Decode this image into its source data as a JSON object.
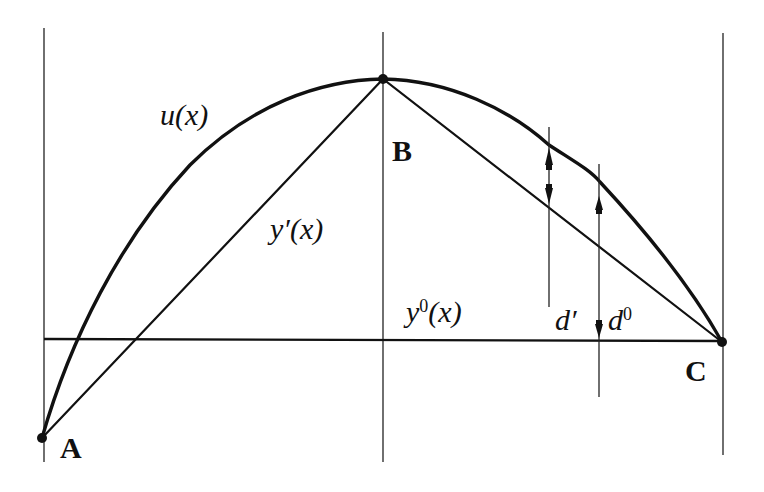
{
  "diagram": {
    "points": {
      "A": {
        "label": "A",
        "x": 42,
        "y": 438
      },
      "B": {
        "label": "B",
        "x": 383,
        "y": 79
      },
      "C": {
        "label": "C",
        "x": 722,
        "y": 342
      }
    },
    "curves": {
      "u": {
        "label_main": "u(x)"
      },
      "y_prime": {
        "label_base": "y",
        "label_mark": "′",
        "label_arg": "(x)"
      },
      "y_zero": {
        "label_base": "y",
        "label_sup": "0",
        "label_arg": "(x)"
      }
    },
    "distances": {
      "d_prime": {
        "label_base": "d",
        "label_mark": "′"
      },
      "d_zero": {
        "label_base": "d",
        "label_sup": "0"
      }
    },
    "colors": {
      "ink": "#111111",
      "background": "#ffffff"
    }
  }
}
